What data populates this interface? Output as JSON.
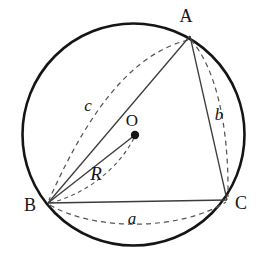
{
  "figure": {
    "background_color": "#ffffff",
    "stroke_color": "#151515",
    "chord_color": "#3c3c3c",
    "dash_color": "#555555",
    "width": 277,
    "height": 257
  },
  "circle": {
    "name": "circumcircle",
    "center_x": 133.5,
    "center_y": 134.5,
    "radius": 111,
    "stroke_width": 2.6
  },
  "center_point": {
    "label": "O",
    "x": 135,
    "y": 135,
    "dot_radius": 4.2,
    "label_x": 132,
    "label_y": 126,
    "font_size": 17
  },
  "vertices": [
    {
      "label": "A",
      "x": 190,
      "y": 36,
      "label_x": 186,
      "label_y": 22,
      "font_size": 18
    },
    {
      "label": "B",
      "x": 48,
      "y": 203,
      "label_x": 30,
      "label_y": 211,
      "font_size": 18
    },
    {
      "label": "C",
      "x": 227,
      "y": 200,
      "label_x": 241,
      "label_y": 209,
      "font_size": 18
    }
  ],
  "sides": [
    {
      "name": "side-ab",
      "from": "B",
      "to": "A",
      "style": "solid",
      "stroke_width": 1.3
    },
    {
      "name": "side-ac",
      "from": "A",
      "to": "C",
      "style": "solid",
      "stroke_width": 1.3
    },
    {
      "name": "side-bc",
      "from": "B",
      "to": "C",
      "style": "solid",
      "stroke_width": 1.5
    }
  ],
  "radius_segment": {
    "name": "radius-bo",
    "from": "B",
    "to": "O",
    "style": "solid",
    "stroke_width": 1.4,
    "label": "R",
    "label_x": 96,
    "label_y": 180,
    "font_size": 19
  },
  "arcs": [
    {
      "name": "arc-c",
      "label": "c",
      "from": "A",
      "to": "B",
      "bulge": "left",
      "path": "M 188 40 C 140 52 95 96 49 200",
      "label_x": 88,
      "label_y": 111,
      "font_size": 17,
      "dash": "5,4"
    },
    {
      "name": "arc-b",
      "label": "b",
      "from": "A",
      "to": "C",
      "bulge": "right",
      "path": "M 191 40 C 214 66 229 120 228 197",
      "label_x": 219,
      "label_y": 120,
      "font_size": 17,
      "dash": "5,4"
    },
    {
      "name": "arc-a",
      "label": "a",
      "from": "B",
      "to": "C",
      "bulge": "down",
      "path": "M 50 205 C 96 232 182 230 226 202",
      "label_x": 132,
      "label_y": 224,
      "font_size": 17,
      "dash": "5,4"
    },
    {
      "name": "arc-radius-marker",
      "label": "",
      "from": "B",
      "to": "O",
      "bulge": "down",
      "path": "M 50 203 C 83 195 117 171 134 138",
      "label_x": 0,
      "label_y": 0,
      "font_size": 0,
      "dash": "4,3.5"
    }
  ]
}
